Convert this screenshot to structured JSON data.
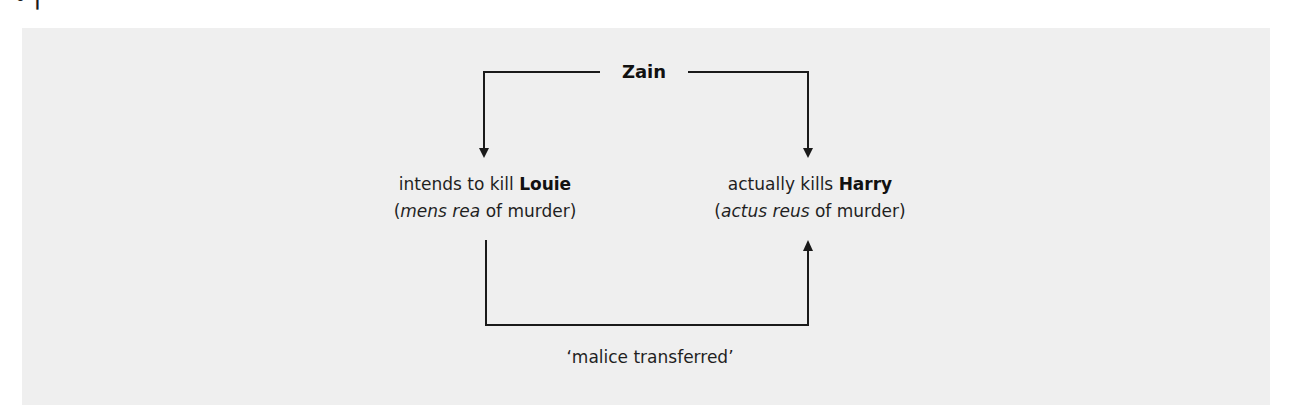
{
  "caption_remnant": "•                |",
  "diagram": {
    "top_node": {
      "label": "Zain"
    },
    "left_node": {
      "line1_prefix": "intends to kill ",
      "line1_bold": "Louie",
      "line2_open": "(",
      "line2_italic": "mens rea",
      "line2_rest": " of murder)"
    },
    "right_node": {
      "line1_prefix": "actually kills ",
      "line1_bold": "Harry",
      "line2_open": "(",
      "line2_italic": "actus reus",
      "line2_rest": " of murder)"
    },
    "bottom_label": "‘malice transferred’",
    "colors": {
      "panel_background": "#efefef",
      "line_color": "#1a1a1a",
      "text_color": "#1f1f1f"
    },
    "edges": [
      {
        "from": "Zain",
        "to": "intends to kill Louie",
        "type": "arrow"
      },
      {
        "from": "Zain",
        "to": "actually kills Harry",
        "type": "arrow"
      },
      {
        "from": "intends to kill Louie",
        "to": "actually kills Harry",
        "type": "arrow",
        "label": "‘malice transferred’"
      }
    ]
  }
}
